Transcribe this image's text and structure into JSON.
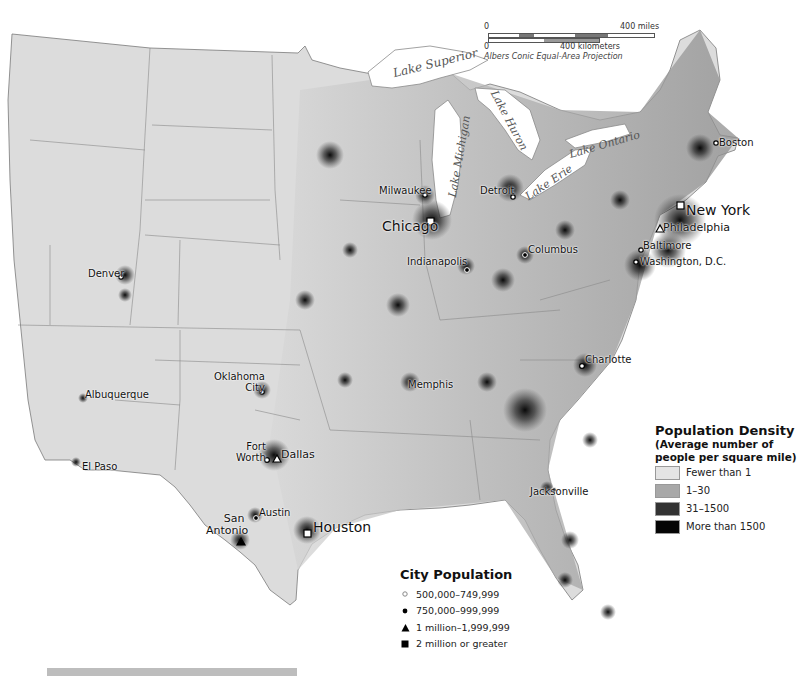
{
  "map": {
    "projection": "Albers Conic Equal-Area Projection",
    "scale_bar": {
      "miles": {
        "start": "0",
        "end": "400 miles"
      },
      "kilometers": {
        "start": "0",
        "end": "400 kilometers"
      }
    },
    "lakes": [
      {
        "name": "Lake Superior"
      },
      {
        "name": "Lake Michigan"
      },
      {
        "name": "Lake Huron"
      },
      {
        "name": "Lake Ontario"
      },
      {
        "name": "Lake Erie"
      }
    ],
    "cities": [
      {
        "name": "New York",
        "class": "2 million or greater"
      },
      {
        "name": "Chicago",
        "class": "2 million or greater"
      },
      {
        "name": "Houston",
        "class": "2 million or greater"
      },
      {
        "name": "Philadelphia",
        "class": "1 million–1,999,999"
      },
      {
        "name": "Dallas",
        "class": "1 million–1,999,999"
      },
      {
        "name": "San Antonio",
        "class": "1 million–1,999,999"
      },
      {
        "name": "Detroit",
        "class": "750,000–999,999"
      },
      {
        "name": "Indianapolis",
        "class": "750,000–999,999"
      },
      {
        "name": "Columbus",
        "class": "750,000–999,999"
      },
      {
        "name": "Charlotte",
        "class": "500,000–749,999"
      },
      {
        "name": "Jacksonville",
        "class": "750,000–999,999"
      },
      {
        "name": "Austin",
        "class": "750,000–999,999"
      },
      {
        "name": "Fort Worth",
        "class": "500,000–749,999"
      },
      {
        "name": "Memphis",
        "class": "500,000–749,999"
      },
      {
        "name": "Oklahoma City",
        "class": "500,000–749,999"
      },
      {
        "name": "Albuquerque",
        "class": "500,000–749,999"
      },
      {
        "name": "El Paso",
        "class": "500,000–749,999"
      },
      {
        "name": "Denver",
        "class": "500,000–749,999"
      },
      {
        "name": "Milwaukee",
        "class": "500,000–749,999"
      },
      {
        "name": "Boston",
        "class": "500,000–749,999"
      },
      {
        "name": "Baltimore",
        "class": "500,000–749,999"
      },
      {
        "name": "Washington, D.C.",
        "class": "500,000–749,999"
      }
    ],
    "labels": {
      "new_york": "New York",
      "chicago": "Chicago",
      "houston": "Houston",
      "philadelphia": "Philadelphia",
      "dallas": "Dallas",
      "san_antonio_1": "San",
      "san_antonio_2": "Antonio",
      "detroit": "Detroit",
      "indianapolis": "Indianapolis",
      "columbus": "Columbus",
      "charlotte": "Charlotte",
      "jacksonville": "Jacksonville",
      "austin": "Austin",
      "fort_worth_1": "Fort",
      "fort_worth_2": "Worth",
      "memphis": "Memphis",
      "okc_1": "Oklahoma",
      "okc_2": "City",
      "albuquerque": "Albuquerque",
      "el_paso": "El Paso",
      "denver": "Denver",
      "milwaukee": "Milwaukee",
      "boston": "Boston",
      "baltimore": "Baltimore",
      "washington": "Washington, D.C."
    }
  },
  "legend_density": {
    "title": "Population Density",
    "subtitle_1": "(Average number of",
    "subtitle_2": "people per square mile)",
    "items": [
      {
        "label": "Fewer than 1",
        "color": "#e4e4e4"
      },
      {
        "label": "1–30",
        "color": "#a8a8a8"
      },
      {
        "label": "31–1500",
        "color": "#333333"
      },
      {
        "label": "More than 1500",
        "color": "#050505"
      }
    ]
  },
  "legend_city": {
    "title": "City Population",
    "items": [
      {
        "label": "500,000–749,999",
        "symbol": "open-circle"
      },
      {
        "label": "750,000–999,999",
        "symbol": "filled-circle"
      },
      {
        "label": "1 million–1,999,999",
        "symbol": "triangle"
      },
      {
        "label": "2 million or greater",
        "symbol": "square"
      }
    ]
  }
}
